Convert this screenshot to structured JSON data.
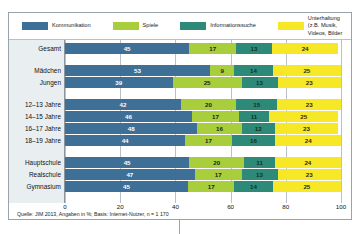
{
  "legend": {
    "items": [
      {
        "label": "Kommunikation",
        "color": "#3e6f96",
        "icon": "legend-swatch-icon"
      },
      {
        "label": "Spiele",
        "color": "#a9ce3c",
        "icon": "legend-swatch-icon"
      },
      {
        "label": "Informationssuche",
        "color": "#2d8a78",
        "icon": "legend-swatch-icon"
      },
      {
        "label": "Unterhaltung (z.B. Musik,\nVideos, Bilder",
        "color": "#f6e827",
        "icon": "legend-swatch-icon"
      }
    ]
  },
  "source_note": "Quelle: JIM 2013, Angaben in %; Basis: Internet-Nutzer, n = 1 170",
  "chart_data": {
    "type": "bar",
    "orientation": "horizontal",
    "stacked": true,
    "title": "",
    "subtitle": "",
    "xlabel": "",
    "ylabel": "",
    "xlim": [
      0,
      100
    ],
    "xticks": [
      0,
      20,
      40,
      60,
      80,
      100
    ],
    "xtick_labels": [
      "0",
      "20",
      "40",
      "60",
      "80",
      "100"
    ],
    "grid": true,
    "legend_position": "top",
    "series": [
      {
        "name": "Kommunikation",
        "color": "#3e6f96",
        "values": [
          45,
          53,
          39,
          42,
          46,
          48,
          44,
          45,
          47,
          45
        ]
      },
      {
        "name": "Spiele",
        "color": "#a9ce3c",
        "values": [
          17,
          9,
          25,
          20,
          17,
          16,
          17,
          20,
          17,
          17
        ]
      },
      {
        "name": "Informationssuche",
        "color": "#2d8a78",
        "values": [
          13,
          14,
          13,
          15,
          11,
          12,
          16,
          11,
          13,
          14
        ]
      },
      {
        "name": "Unterhaltung (z.B. Musik, Videos, Bilder",
        "color": "#f6e827",
        "values": [
          24,
          25,
          23,
          23,
          25,
          23,
          24,
          24,
          23,
          25
        ]
      }
    ],
    "categories": [
      "Gesamt",
      "Mädchen",
      "Jungen",
      "12–13 Jahre",
      "14–15 Jahre",
      "16–17 Jahre",
      "18–19 Jahre",
      "Hauptschule",
      "Realschule",
      "Gymnasium"
    ],
    "category_groups": [
      {
        "rows": [
          0
        ]
      },
      {
        "rows": [
          1,
          2
        ]
      },
      {
        "rows": [
          3,
          4,
          5,
          6
        ]
      },
      {
        "rows": [
          7,
          8,
          9
        ]
      }
    ]
  }
}
